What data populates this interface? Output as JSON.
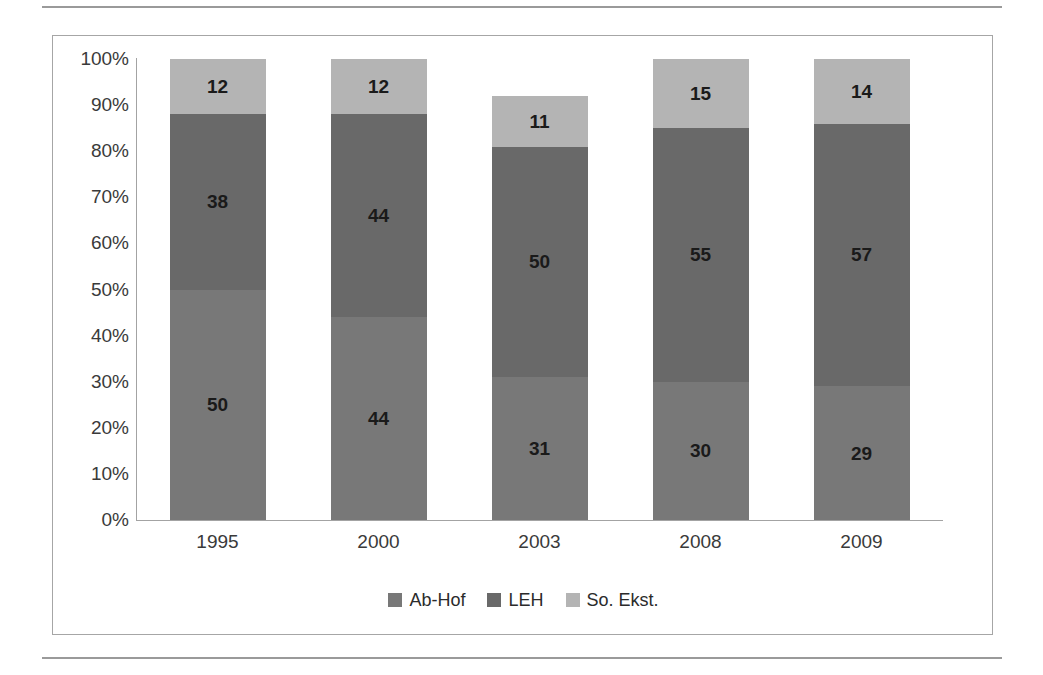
{
  "chart_data": {
    "type": "bar",
    "subtype": "stacked-100-percent",
    "title": "",
    "xlabel": "",
    "ylabel": "",
    "categories": [
      "1995",
      "2000",
      "2003",
      "2008",
      "2009"
    ],
    "series": [
      {
        "name": "Ab-Hof",
        "color": "#787878",
        "values": [
          50,
          44,
          31,
          30,
          29
        ]
      },
      {
        "name": "LEH",
        "color": "#696969",
        "values": [
          38,
          44,
          50,
          55,
          57
        ]
      },
      {
        "name": "So. Ekst.",
        "color": "#b4b4b4",
        "values": [
          12,
          12,
          11,
          15,
          14
        ]
      }
    ],
    "y_ticks": [
      "100%",
      "90%",
      "80%",
      "70%",
      "60%",
      "50%",
      "40%",
      "30%",
      "20%",
      "10%",
      "0%"
    ],
    "ylim": [
      0,
      100
    ],
    "grid": false,
    "legend_position": "bottom",
    "data_labels": true
  },
  "legend": {
    "items": [
      {
        "label": "Ab-Hof",
        "color": "#787878"
      },
      {
        "label": "LEH",
        "color": "#696969"
      },
      {
        "label": "So. Ekst.",
        "color": "#b4b4b4"
      }
    ]
  }
}
